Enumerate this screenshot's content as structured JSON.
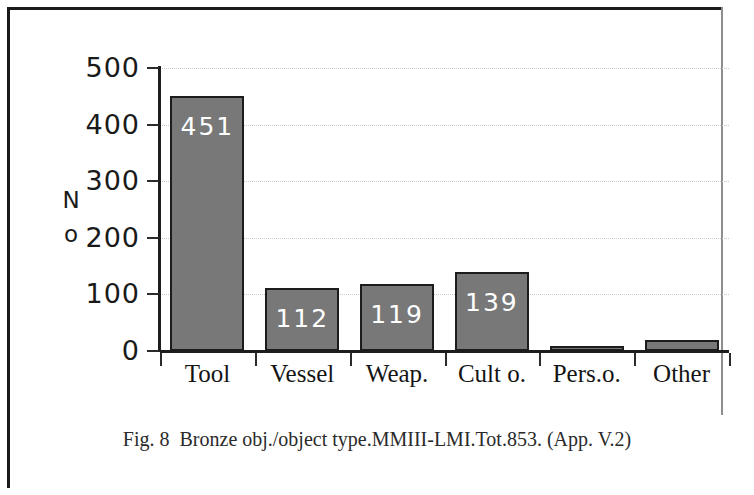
{
  "figure": {
    "caption_label": "Fig. 8",
    "caption_text": "Bronze obj./object type.MMIII-LMI.Tot.853. (App. V.2)"
  },
  "chart_data": {
    "type": "bar",
    "title": "",
    "xlabel": "",
    "ylabel": "No",
    "ylabel_lines": [
      "N",
      "o"
    ],
    "categories": [
      "Tool",
      "Vessel",
      "Weap.",
      "Cult o.",
      "Pers.o.",
      "Other"
    ],
    "values": [
      451,
      112,
      119,
      139,
      9,
      19
    ],
    "data_labels": [
      "451",
      "112",
      "119",
      "139",
      "",
      ""
    ],
    "ylim": [
      0,
      500
    ],
    "yticks": [
      0,
      100,
      200,
      300,
      400,
      500
    ],
    "ytick_labels": [
      "0",
      "100",
      "200",
      "300",
      "400",
      "500"
    ],
    "grid": true,
    "grid_style": "dotted",
    "legend": "none",
    "total": 853,
    "bar_color": "#787878",
    "bar_edge_color": "#1c1c1c",
    "label_color": "#ffffff",
    "grid_color": "#c9c9c9",
    "axis_color": "#1d1d1d"
  }
}
